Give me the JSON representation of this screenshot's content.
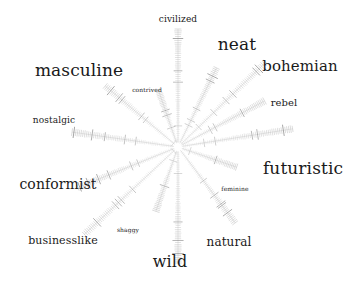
{
  "figure": {
    "type": "radial-spoke-diagram",
    "background_color": "#ffffff",
    "text_color": "#1a1a1a",
    "spoke_color": "#b9b9b9",
    "spoke_accent_color": "#6e6e6e",
    "center": {
      "x": 178,
      "y": 147
    },
    "spoke_count": 14
  },
  "chart_data": {
    "type": "radial",
    "title": "",
    "xlabel": "",
    "ylabel": "",
    "center": {
      "x": 178,
      "y": 147
    },
    "legend_position": "none",
    "grid": false,
    "categories": [
      "civilized",
      "neat",
      "bohemian",
      "rebel",
      "futuristic",
      "feminine",
      "natural",
      "wild",
      "shaggy",
      "businesslike",
      "conformist",
      "nostalgic",
      "masculine",
      "contrived"
    ],
    "series": [
      {
        "name": "spoke length (px)",
        "values": [
          118,
          88,
          122,
          98,
          116,
          62,
          95,
          116,
          68,
          128,
          108,
          107,
          95,
          60
        ]
      },
      {
        "name": "label prominence (font px)",
        "values": [
          9,
          17,
          15,
          10,
          17,
          6,
          12,
          16,
          6,
          11,
          14,
          9,
          17,
          6
        ]
      }
    ],
    "spokes": [
      {
        "label": "civilized",
        "angle_deg": 90.0,
        "length": 118,
        "font_size": 9,
        "ticks": 60
      },
      {
        "label": "neat",
        "angle_deg": 64.0,
        "length": 88,
        "font_size": 17,
        "ticks": 46
      },
      {
        "label": "bohemian",
        "angle_deg": 44.0,
        "length": 122,
        "font_size": 15,
        "ticks": 62
      },
      {
        "label": "rebel",
        "angle_deg": 28.0,
        "length": 98,
        "font_size": 10,
        "ticks": 52
      },
      {
        "label": "futuristic",
        "angle_deg": 9.0,
        "length": 116,
        "font_size": 17,
        "ticks": 60
      },
      {
        "label": "feminine",
        "angle_deg": -19.0,
        "length": 62,
        "font_size": 6,
        "ticks": 34
      },
      {
        "label": "natural",
        "angle_deg": -53.0,
        "length": 95,
        "font_size": 12,
        "ticks": 50
      },
      {
        "label": "wild",
        "angle_deg": -90.0,
        "length": 116,
        "font_size": 16,
        "ticks": 60
      },
      {
        "label": "shaggy",
        "angle_deg": -109.0,
        "length": 68,
        "font_size": 6,
        "ticks": 36
      },
      {
        "label": "businesslike",
        "angle_deg": -137.0,
        "length": 128,
        "font_size": 11,
        "ticks": 64
      },
      {
        "label": "conformist",
        "angle_deg": -158.0,
        "length": 108,
        "font_size": 14,
        "ticks": 56
      },
      {
        "label": "nostalgic",
        "angle_deg": 172.0,
        "length": 107,
        "font_size": 9,
        "ticks": 56
      },
      {
        "label": "masculine",
        "angle_deg": 140.0,
        "length": 95,
        "font_size": 17,
        "ticks": 50
      },
      {
        "label": "contrived",
        "angle_deg": 109.0,
        "length": 60,
        "font_size": 6,
        "ticks": 34
      }
    ]
  },
  "labels": [
    {
      "name": "label-civilized",
      "text": "civilized",
      "x": 178,
      "y": 19,
      "font_size": 9,
      "anchor": "mid"
    },
    {
      "name": "label-neat",
      "text": "neat",
      "x": 237,
      "y": 44,
      "font_size": 17,
      "anchor": "mid"
    },
    {
      "name": "label-bohemian",
      "text": "bohemian",
      "x": 300,
      "y": 66,
      "font_size": 15,
      "anchor": "mid"
    },
    {
      "name": "label-rebel",
      "text": "rebel",
      "x": 284,
      "y": 103,
      "font_size": 10,
      "anchor": "mid"
    },
    {
      "name": "label-futuristic",
      "text": "futuristic",
      "x": 303,
      "y": 168,
      "font_size": 17,
      "anchor": "mid"
    },
    {
      "name": "label-feminine",
      "text": "feminine",
      "x": 235,
      "y": 189,
      "font_size": 6,
      "anchor": "mid"
    },
    {
      "name": "label-natural",
      "text": "natural",
      "x": 229,
      "y": 242,
      "font_size": 12,
      "anchor": "mid"
    },
    {
      "name": "label-wild",
      "text": "wild",
      "x": 170,
      "y": 262,
      "font_size": 16,
      "anchor": "mid"
    },
    {
      "name": "label-shaggy",
      "text": "shaggy",
      "x": 128,
      "y": 230,
      "font_size": 6,
      "anchor": "mid"
    },
    {
      "name": "label-businesslike",
      "text": "businesslike",
      "x": 63,
      "y": 240,
      "font_size": 11,
      "anchor": "mid"
    },
    {
      "name": "label-conformist",
      "text": "conformist",
      "x": 58,
      "y": 184,
      "font_size": 14,
      "anchor": "mid"
    },
    {
      "name": "label-nostalgic",
      "text": "nostalgic",
      "x": 54,
      "y": 120,
      "font_size": 9,
      "anchor": "mid"
    },
    {
      "name": "label-masculine",
      "text": "masculine",
      "x": 79,
      "y": 70,
      "font_size": 17,
      "anchor": "mid"
    },
    {
      "name": "label-contrived",
      "text": "contrived",
      "x": 147,
      "y": 90,
      "font_size": 6,
      "anchor": "mid"
    }
  ]
}
